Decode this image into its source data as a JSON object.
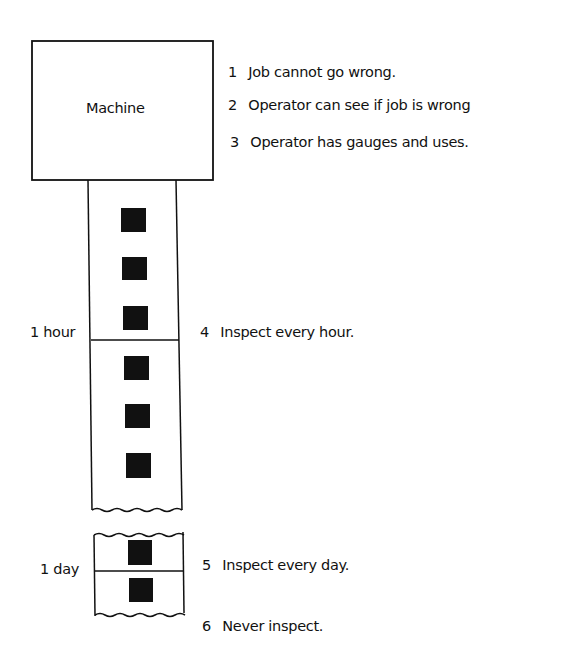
{
  "machine": {
    "label": "Machine"
  },
  "notes": [
    {
      "num": "1",
      "text": "Job cannot go wrong."
    },
    {
      "num": "2",
      "text": "Operator can see if job is wrong"
    },
    {
      "num": "3",
      "text": "Operator has gauges and uses."
    },
    {
      "num": "4",
      "text": "Inspect every hour."
    },
    {
      "num": "5",
      "text": "Inspect every day."
    },
    {
      "num": "6",
      "text": "Never inspect."
    }
  ],
  "intervals": {
    "hour": "1 hour",
    "day": "1 day"
  },
  "colors": {
    "ink": "#111111",
    "background": "#ffffff"
  }
}
